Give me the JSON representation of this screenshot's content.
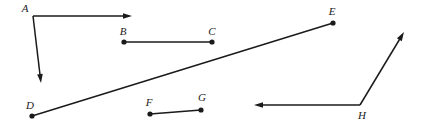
{
  "figure": {
    "width": 425,
    "height": 128,
    "background_color": "#ffffff",
    "ink_color": "#1a1a1a"
  },
  "labels": {
    "a": "A",
    "b": "B",
    "c": "C",
    "d": "D",
    "e": "E",
    "f": "F",
    "g": "G",
    "h": "H"
  },
  "points": [
    {
      "name": "A",
      "label": "A",
      "x": 33,
      "y": 16,
      "label_x": 25,
      "label_y": 12,
      "has_dot": false
    },
    {
      "name": "B",
      "label": "B",
      "x": 124,
      "y": 42,
      "label_x": 123,
      "label_y": 35,
      "has_dot": true
    },
    {
      "name": "C",
      "label": "C",
      "x": 212,
      "y": 42,
      "label_x": 212,
      "label_y": 35,
      "has_dot": true
    },
    {
      "name": "D",
      "label": "D",
      "x": 32,
      "y": 116,
      "label_x": 30,
      "label_y": 109,
      "has_dot": true
    },
    {
      "name": "E",
      "label": "E",
      "x": 333,
      "y": 23,
      "label_x": 332,
      "label_y": 15,
      "has_dot": true
    },
    {
      "name": "F",
      "label": "F",
      "x": 150,
      "y": 114,
      "label_x": 149,
      "label_y": 106,
      "has_dot": true
    },
    {
      "name": "G",
      "label": "G",
      "x": 201,
      "y": 110,
      "label_x": 202,
      "label_y": 101,
      "has_dot": true
    },
    {
      "name": "H",
      "label": "H",
      "x": 360,
      "y": 105,
      "label_x": 362,
      "label_y": 119,
      "has_dot": false
    }
  ],
  "strokes": [
    {
      "name": "ray-a-right",
      "kind": "ray",
      "from": [
        33,
        16
      ],
      "to": [
        132,
        16
      ],
      "arrow_at_end": true
    },
    {
      "name": "ray-a-down",
      "kind": "ray",
      "from": [
        33,
        16
      ],
      "to": [
        41,
        83
      ],
      "arrow_at_end": true
    },
    {
      "name": "segment-bc",
      "kind": "segment",
      "from": [
        124,
        42
      ],
      "to": [
        212,
        42
      ],
      "arrow_at_end": false
    },
    {
      "name": "segment-de",
      "kind": "segment",
      "from": [
        32,
        116
      ],
      "to": [
        333,
        23
      ],
      "arrow_at_end": false
    },
    {
      "name": "segment-fg",
      "kind": "segment",
      "from": [
        150,
        114
      ],
      "to": [
        201,
        110
      ],
      "arrow_at_end": false
    },
    {
      "name": "ray-h-left",
      "kind": "ray",
      "from": [
        360,
        105
      ],
      "to": [
        254,
        105
      ],
      "arrow_at_end": true
    },
    {
      "name": "ray-h-upright",
      "kind": "ray",
      "from": [
        360,
        105
      ],
      "to": [
        404,
        32
      ],
      "arrow_at_end": true
    }
  ],
  "style": {
    "dot_radius": 2.6,
    "stroke_width": 1.5,
    "arrow_length": 9,
    "arrow_half_width": 2.8,
    "label_font_size": 11
  }
}
